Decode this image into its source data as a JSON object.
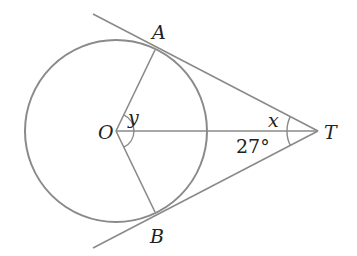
{
  "diagram": {
    "type": "circle-tangent-geometry",
    "colors": {
      "stroke": "#8a8a8a",
      "text": "#222222",
      "background": "#ffffff"
    },
    "points": {
      "O": {
        "label": "O"
      },
      "A": {
        "label": "A"
      },
      "B": {
        "label": "B"
      },
      "T": {
        "label": "T"
      }
    },
    "angles": {
      "x": {
        "label": "x",
        "description": "angle ATO"
      },
      "y": {
        "label": "y",
        "description": "angle AOT"
      },
      "btO": {
        "label": "27°",
        "description": "angle OTB"
      }
    },
    "elements": [
      "circle centered at O",
      "tangent line TA",
      "tangent line TB",
      "radius OA",
      "radius OB",
      "segment OT"
    ]
  }
}
